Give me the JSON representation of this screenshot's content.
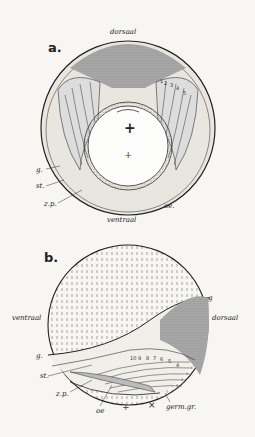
{
  "figure_a": {
    "panel_label": "a.",
    "dorsal": "dorsaal",
    "ventral": "ventraal",
    "g": "g.",
    "st": "st.",
    "zp": "z.p.",
    "oe": "oe.",
    "plus": "+",
    "plus_small": "+",
    "numbers": [
      "1",
      "2",
      "3",
      "4",
      "5"
    ]
  },
  "figure_b": {
    "panel_label": "b.",
    "ventral": "ventraal",
    "dorsal": "dorsaal",
    "g_right": "g",
    "g_left": "g.",
    "st": "st.",
    "zp": "z.p.",
    "oe": "oe",
    "plus_small": "+",
    "cross": "×",
    "germ": "germ.gr.",
    "numbers": [
      "10",
      "9",
      "8",
      "7",
      "6",
      "5",
      "4"
    ]
  }
}
